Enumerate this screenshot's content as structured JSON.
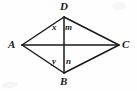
{
  "figure": {
    "type": "geometry-diagram",
    "background_color": "#fefefe",
    "stroke_color": "#1a1a1a",
    "vertices": [
      {
        "id": "D",
        "label": "D",
        "x": 64,
        "y": 17
      },
      {
        "id": "A",
        "label": "A",
        "x": 22,
        "y": 45
      },
      {
        "id": "C",
        "label": "C",
        "x": 119,
        "y": 45
      },
      {
        "id": "B",
        "label": "B",
        "x": 64,
        "y": 73
      }
    ],
    "intersection": {
      "id": "O",
      "x": 64,
      "y": 45
    },
    "edges": [
      {
        "from": "A",
        "to": "D"
      },
      {
        "from": "D",
        "to": "C"
      },
      {
        "from": "C",
        "to": "B"
      },
      {
        "from": "B",
        "to": "A"
      }
    ],
    "diagonals": [
      {
        "from": "A",
        "to": "C",
        "orientation": "horizontal"
      },
      {
        "from": "D",
        "to": "B",
        "orientation": "vertical"
      }
    ],
    "angle_labels": [
      {
        "id": "x",
        "label": "x",
        "at_vertex": "D",
        "side": "left"
      },
      {
        "id": "m",
        "label": "m",
        "at_vertex": "D",
        "side": "right"
      },
      {
        "id": "y",
        "label": "y",
        "at_vertex": "B",
        "side": "left"
      },
      {
        "id": "n",
        "label": "n",
        "at_vertex": "B",
        "side": "right"
      }
    ]
  }
}
